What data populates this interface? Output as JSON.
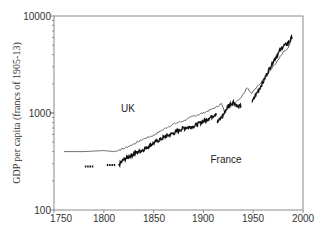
{
  "chart_data": {
    "type": "line",
    "title": "",
    "xlabel": "",
    "ylabel": "GDP per capita (francs of 1905-13)",
    "yscale": "log",
    "xlim": [
      1750,
      2000
    ],
    "ylim": [
      100,
      10000
    ],
    "grid": false,
    "legend": "inline labels",
    "x_ticks": [
      1750,
      1800,
      1850,
      1900,
      1950,
      2000
    ],
    "x_tick_labels": [
      "1750",
      "1800",
      "1850",
      "1900",
      "1950",
      "2000"
    ],
    "y_ticks": [
      100,
      1000,
      10000
    ],
    "y_tick_labels": [
      "100",
      "1000",
      "10000"
    ],
    "annotations": [
      {
        "text": "UK",
        "x": 1832,
        "y": 1100
      },
      {
        "text": "France",
        "x": 1908,
        "y": 380
      }
    ],
    "series": [
      {
        "name": "UK",
        "style": "thin line",
        "x": [
          1760,
          1780,
          1800,
          1810,
          1820,
          1830,
          1840,
          1850,
          1860,
          1870,
          1880,
          1890,
          1900,
          1913,
          1918,
          1921,
          1930,
          1938,
          1944,
          1948,
          1955,
          1960,
          1970,
          1975,
          1980,
          1985,
          1989
        ],
        "values": [
          400,
          400,
          410,
          400,
          430,
          480,
          540,
          590,
          680,
          770,
          830,
          930,
          1000,
          1150,
          1250,
          1050,
          1250,
          1450,
          1850,
          1600,
          1900,
          2200,
          3000,
          3500,
          4200,
          4600,
          5900
        ]
      },
      {
        "name": "France",
        "style": "thick jagged line",
        "x": [
          1781,
          1790,
          1803,
          1812,
          1815,
          1820,
          1830,
          1840,
          1850,
          1860,
          1870,
          1880,
          1890,
          1900,
          1910,
          1913,
          1914,
          1920,
          1925,
          1930,
          1935,
          1938,
          1949,
          1955,
          1960,
          1965,
          1970,
          1975,
          1980,
          1985,
          1989
        ],
        "values": [
          280,
          280,
          290,
          290,
          290,
          330,
          380,
          420,
          490,
          560,
          620,
          700,
          730,
          820,
          940,
          1000,
          800,
          950,
          1200,
          1300,
          1150,
          1200,
          1300,
          1700,
          2100,
          2700,
          3400,
          4100,
          4900,
          5200,
          6100
        ]
      }
    ]
  },
  "axes": {
    "ylabel": "GDP per capita (francs of 1905-13)",
    "x_ticks": [
      "1750",
      "1800",
      "1850",
      "1900",
      "1950",
      "2000"
    ],
    "y_ticks": [
      "100",
      "1000",
      "10000"
    ]
  },
  "labels": {
    "uk": "UK",
    "france": "France"
  }
}
